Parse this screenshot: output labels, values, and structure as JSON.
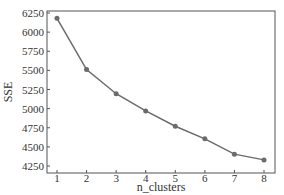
{
  "chart_data": {
    "type": "line",
    "title": "",
    "xlabel": "n_clusters",
    "ylabel": "SSE",
    "x": [
      1,
      2,
      3,
      4,
      5,
      6,
      7,
      8
    ],
    "series": [
      {
        "name": "SSE",
        "values": [
          6180,
          5510,
          5195,
          4970,
          4770,
          4605,
          4405,
          4330
        ],
        "color": "#6b6b6b",
        "marker": "circle"
      }
    ],
    "xticks": [
      "1",
      "2",
      "3",
      "4",
      "5",
      "6",
      "7",
      "8"
    ],
    "yticks": [
      "4250",
      "4500",
      "4750",
      "5000",
      "5250",
      "5500",
      "5750",
      "6000",
      "6250"
    ],
    "ylim": [
      4250,
      6250
    ],
    "xlim": [
      0.7,
      8.3
    ],
    "grid": false,
    "legend": null
  }
}
